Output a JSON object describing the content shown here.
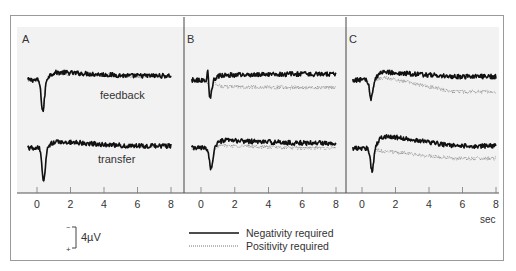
{
  "chart_data": {
    "type": "line",
    "title": "",
    "xlabel": "sec",
    "ylabel": "",
    "xlim": [
      -0.8,
      8.2
    ],
    "x_ticks": [
      0,
      2,
      4,
      6,
      8
    ],
    "grid": false,
    "legend_position": "bottom-center",
    "scale_bar": {
      "label": "4µV",
      "top_sign": "−",
      "bottom_sign": "+",
      "note": "negative up"
    },
    "legend": [
      {
        "name": "Negativity required",
        "style": "solid"
      },
      {
        "name": "Positivity required",
        "style": "dotted"
      }
    ],
    "panels": [
      {
        "label": "A",
        "rows": [
          {
            "name": "feedback",
            "label_text": "feedback",
            "series": [
              {
                "name": "Negativity required",
                "baseline_uV": 0,
                "trough_time_s": 0.35,
                "trough_uV": -7.5,
                "post_level_uV": 1.8,
                "late_level_uV": 1.0
              },
              {
                "name": "Positivity required",
                "baseline_uV": 0,
                "trough_time_s": 0.35,
                "trough_uV": -7.5,
                "post_level_uV": 1.6,
                "late_level_uV": 0.9
              }
            ]
          },
          {
            "name": "transfer",
            "label_text": "transfer",
            "series": [
              {
                "name": "Negativity required",
                "baseline_uV": 0,
                "trough_time_s": 0.4,
                "trough_uV": -8.0,
                "post_level_uV": 1.5,
                "late_level_uV": 0.5
              },
              {
                "name": "Positivity required",
                "baseline_uV": 0,
                "trough_time_s": 0.4,
                "trough_uV": -8.0,
                "post_level_uV": 1.3,
                "late_level_uV": 0.4
              }
            ]
          }
        ]
      },
      {
        "label": "B",
        "rows": [
          {
            "name": "feedback",
            "series": [
              {
                "name": "Negativity required",
                "baseline_uV": 0,
                "trough_time_s": 0.55,
                "trough_uV": -4.0,
                "spike_uV": 4.0,
                "post_level_uV": 1.2,
                "late_level_uV": 1.4
              },
              {
                "name": "Positivity required",
                "baseline_uV": 0,
                "trough_time_s": 0.55,
                "trough_uV": -2.5,
                "post_level_uV": -1.6,
                "late_level_uV": -1.8
              }
            ]
          },
          {
            "name": "transfer",
            "series": [
              {
                "name": "Negativity required",
                "baseline_uV": 0,
                "trough_time_s": 0.6,
                "trough_uV": -5.0,
                "post_level_uV": 1.8,
                "late_level_uV": 1.2
              },
              {
                "name": "Positivity required",
                "baseline_uV": 0,
                "trough_time_s": 0.6,
                "trough_uV": -5.0,
                "post_level_uV": 0.6,
                "late_level_uV": 0.0
              }
            ]
          }
        ]
      },
      {
        "label": "C",
        "rows": [
          {
            "name": "feedback",
            "series": [
              {
                "name": "Negativity required",
                "baseline_uV": 0,
                "trough_time_s": 0.55,
                "trough_uV": -4.5,
                "post_level_uV": 1.8,
                "late_level_uV": 0.8
              },
              {
                "name": "Positivity required",
                "baseline_uV": 0,
                "trough_time_s": 0.55,
                "trough_uV": -4.5,
                "post_level_uV": 0.5,
                "late_level_uV": -2.8
              }
            ]
          },
          {
            "name": "transfer",
            "series": [
              {
                "name": "Negativity required",
                "baseline_uV": 0,
                "trough_time_s": 0.6,
                "trough_uV": -5.5,
                "post_level_uV": 2.8,
                "late_level_uV": 0.5
              },
              {
                "name": "Positivity required",
                "baseline_uV": 0,
                "trough_time_s": 0.6,
                "trough_uV": -5.5,
                "post_level_uV": -0.8,
                "late_level_uV": -2.5
              }
            ]
          }
        ]
      }
    ]
  },
  "labels": {
    "panel_a": "A",
    "panel_b": "B",
    "panel_c": "C",
    "feedback": "feedback",
    "transfer": "transfer",
    "x_unit": "sec",
    "scale_value": "4µV",
    "scale_minus": "−",
    "scale_plus": "+",
    "legend_solid": "Negativity required",
    "legend_dotted": "Positivity required",
    "tick_labels": [
      "0",
      "2",
      "4",
      "6",
      "8"
    ]
  },
  "colors": {
    "frame": "#9a9a9a",
    "plot_bg": "#f2f2f2",
    "axis": "#555555",
    "divider": "#444444",
    "solid_trace": "#111111",
    "dotted_trace": "#8a8a8a",
    "text": "#333333"
  }
}
